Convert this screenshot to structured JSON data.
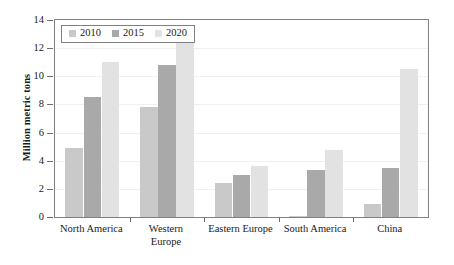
{
  "chart_data": {
    "type": "bar",
    "title": "",
    "subtitle": "",
    "xlabel": "",
    "ylabel": "Million metric tons",
    "ylim": [
      0,
      14
    ],
    "ytick_labels": [
      "0",
      "2",
      "4",
      "6",
      "8",
      "10",
      "12",
      "14"
    ],
    "ytick_values": [
      0,
      2,
      4,
      6,
      8,
      10,
      12,
      14
    ],
    "grid": true,
    "grid_axis": "y",
    "legend_position": "upper left",
    "categories": [
      "North America",
      "Western\nEurope",
      "Eastern Europe",
      "South America",
      "China"
    ],
    "series": [
      {
        "name": "2010",
        "color": "#c9c9c9",
        "values": [
          4.9,
          7.8,
          2.4,
          0.05,
          0.9
        ]
      },
      {
        "name": "2015",
        "color": "#a9a9a9",
        "values": [
          8.5,
          10.8,
          3.0,
          3.35,
          3.45
        ]
      },
      {
        "name": "2020",
        "color": "#e2e2e2",
        "values": [
          11.0,
          13.1,
          3.6,
          4.75,
          10.5
        ]
      }
    ]
  },
  "legend": {
    "items": [
      {
        "label": "2010",
        "color": "#c9c9c9"
      },
      {
        "label": "2015",
        "color": "#a9a9a9"
      },
      {
        "label": "2020",
        "color": "#e2e2e2"
      }
    ]
  },
  "axes": {
    "y_title": "Million metric tons"
  },
  "colors": {
    "series_2010": "#c9c9c9",
    "series_2015": "#a9a9a9",
    "series_2020": "#e2e2e2",
    "axis": "#808080",
    "grid": "#f0f0f0",
    "text": "#1a1a1a",
    "background": "#ffffff"
  }
}
